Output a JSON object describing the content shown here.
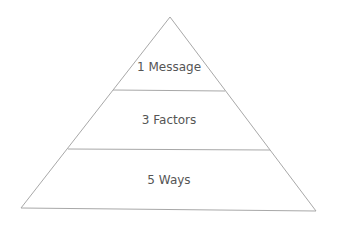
{
  "diagram": {
    "type": "pyramid",
    "levels": [
      {
        "label": "1 Message"
      },
      {
        "label": "3 Factors"
      },
      {
        "label": "5 Ways"
      }
    ],
    "colors": {
      "stroke": "#a8a8a8",
      "fill": "#ffffff",
      "text": "#555555"
    }
  }
}
